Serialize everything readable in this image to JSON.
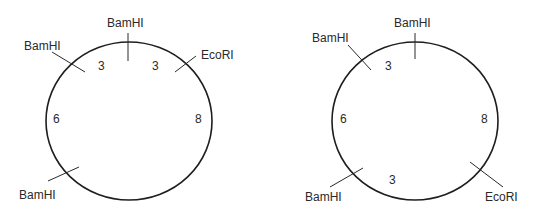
{
  "maps": [
    {
      "id": "map-1",
      "sites": [
        {
          "enzyme": "BamHI",
          "position": "top"
        },
        {
          "enzyme": "EcoRI",
          "position": "upper-right"
        },
        {
          "enzyme": "BamHI",
          "position": "upper-left"
        },
        {
          "enzyme": "BamHI",
          "position": "lower-left"
        }
      ],
      "fragments": [
        {
          "size": "3",
          "between": "upper-left BamHI to top BamHI"
        },
        {
          "size": "3",
          "between": "top BamHI to EcoRI"
        },
        {
          "size": "8",
          "between": "EcoRI to lower-left BamHI"
        },
        {
          "size": "6",
          "between": "lower-left BamHI to upper-left BamHI"
        }
      ]
    },
    {
      "id": "map-2",
      "sites": [
        {
          "enzyme": "BamHI",
          "position": "top"
        },
        {
          "enzyme": "BamHI",
          "position": "upper-left"
        },
        {
          "enzyme": "BamHI",
          "position": "lower-left"
        },
        {
          "enzyme": "EcoRI",
          "position": "lower-right"
        }
      ],
      "fragments": [
        {
          "size": "3",
          "between": "upper-left BamHI to top BamHI"
        },
        {
          "size": "8",
          "between": "top BamHI to EcoRI"
        },
        {
          "size": "3",
          "between": "EcoRI to lower-left BamHI"
        },
        {
          "size": "6",
          "between": "lower-left BamHI to upper-left BamHI"
        }
      ]
    }
  ]
}
